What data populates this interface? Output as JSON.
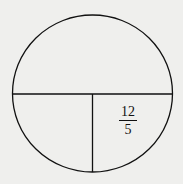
{
  "diagram": {
    "shape": "circle",
    "segments": [
      "horizontal-diameter",
      "vertical-radius-segment"
    ],
    "label": {
      "numerator": "12",
      "denominator": "5"
    },
    "colors": {
      "background": "#efefed",
      "stroke": "#111111"
    }
  }
}
